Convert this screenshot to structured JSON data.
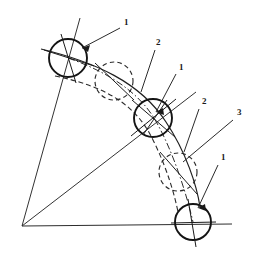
{
  "figure": {
    "background_color": "#ffffff",
    "ink_color": "#1a1a1a",
    "width": 255,
    "height": 278
  },
  "labels": [
    {
      "id": "label-1-top",
      "text": "1",
      "x": 124,
      "y": 25
    },
    {
      "id": "label-2-upper",
      "text": "2",
      "x": 156,
      "y": 45
    },
    {
      "id": "label-1-middle",
      "text": "1",
      "x": 179,
      "y": 70
    },
    {
      "id": "label-2-lower",
      "text": "2",
      "x": 202,
      "y": 104
    },
    {
      "id": "label-3-right",
      "text": "3",
      "x": 237,
      "y": 115
    },
    {
      "id": "label-1-bottom",
      "text": "1",
      "x": 221,
      "y": 160
    }
  ],
  "circles": [
    {
      "id": "roller-top",
      "style": "solid",
      "cx": 68,
      "cy": 58,
      "r": 19
    },
    {
      "id": "roller-middle",
      "style": "solid",
      "cx": 153,
      "cy": 118,
      "r": 19
    },
    {
      "id": "roller-bottom",
      "style": "solid",
      "cx": 193,
      "cy": 222,
      "r": 18
    },
    {
      "id": "roller-phantom-upper",
      "style": "dashed",
      "cx": 114,
      "cy": 81,
      "r": 19
    },
    {
      "id": "roller-phantom-lower",
      "style": "dashed",
      "cx": 178,
      "cy": 172,
      "r": 19
    }
  ],
  "vertex": {
    "id": "pivot-origin",
    "x": 22,
    "y": 226
  },
  "leader_lines": [
    {
      "id": "leader-1-top",
      "from_x": 120,
      "from_y": 28,
      "to_x": 82,
      "to_y": 48,
      "arrow": true
    },
    {
      "id": "leader-2-upper",
      "from_x": 155,
      "from_y": 50,
      "to_x": 141,
      "to_y": 92,
      "arrow": false
    },
    {
      "id": "leader-1-middle",
      "from_x": 176,
      "from_y": 74,
      "to_x": 156,
      "to_y": 112,
      "arrow": true
    },
    {
      "id": "leader-2-lower",
      "from_x": 199,
      "from_y": 109,
      "to_x": 184,
      "to_y": 152,
      "arrow": false
    },
    {
      "id": "leader-3-right",
      "from_x": 233,
      "from_y": 120,
      "to_x": 183,
      "to_y": 162,
      "arrow": false
    },
    {
      "id": "leader-1-bottom",
      "from_x": 218,
      "from_y": 165,
      "to_x": 198,
      "to_y": 208,
      "arrow": true
    }
  ],
  "notes": {
    "legend_1": "1",
    "legend_2": "2",
    "legend_3": "3"
  }
}
